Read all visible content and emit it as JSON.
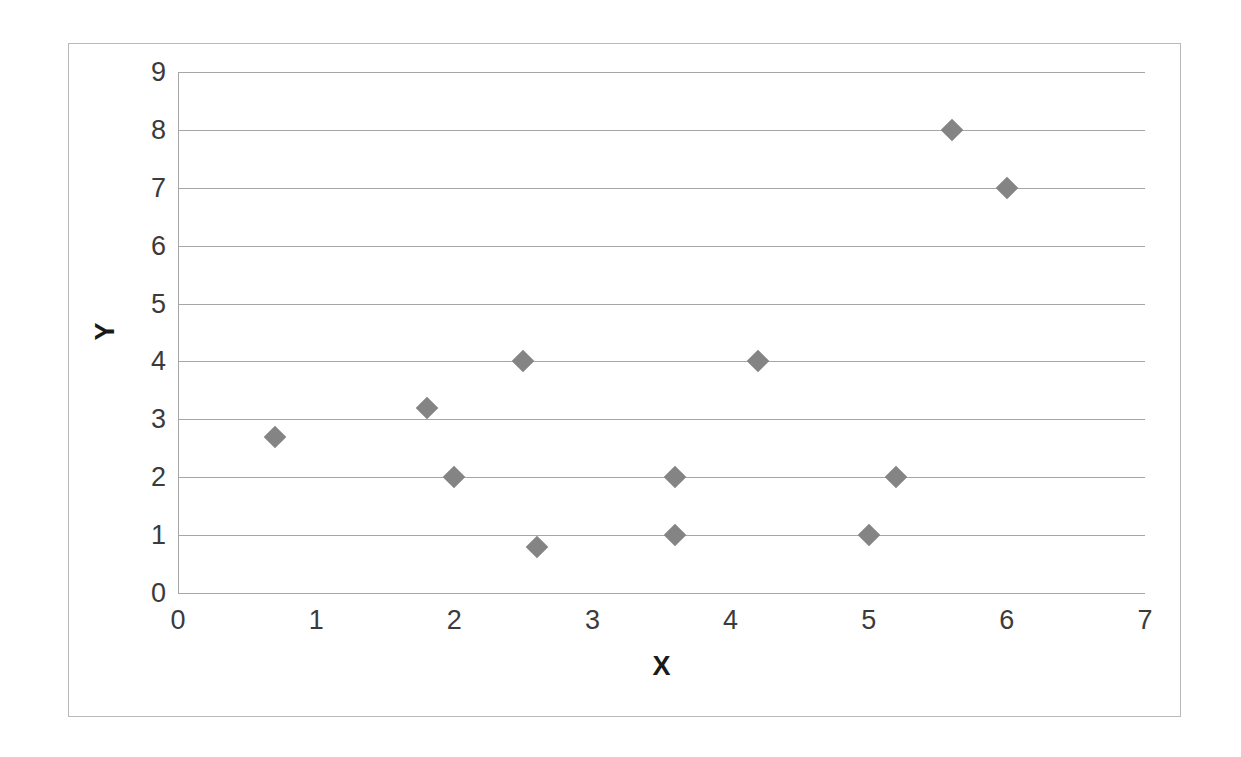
{
  "chart_data": {
    "type": "scatter",
    "title": "",
    "xlabel": "X",
    "ylabel": "Y",
    "xlim": [
      0,
      7
    ],
    "ylim": [
      0,
      9
    ],
    "x_ticks": [
      "0",
      "1",
      "2",
      "3",
      "4",
      "5",
      "6",
      "7"
    ],
    "y_ticks": [
      "0",
      "1",
      "2",
      "3",
      "4",
      "5",
      "6",
      "7",
      "8",
      "9"
    ],
    "grid": "horizontal",
    "legend": "none",
    "marker_shape": "diamond",
    "marker_color": "#848484",
    "series": [
      {
        "name": "series-1",
        "points": [
          {
            "x": 0.7,
            "y": 2.7
          },
          {
            "x": 1.8,
            "y": 3.2
          },
          {
            "x": 2.0,
            "y": 2.0
          },
          {
            "x": 2.5,
            "y": 4.0
          },
          {
            "x": 2.6,
            "y": 0.8
          },
          {
            "x": 3.6,
            "y": 2.0
          },
          {
            "x": 3.6,
            "y": 1.0
          },
          {
            "x": 4.2,
            "y": 4.0
          },
          {
            "x": 5.0,
            "y": 1.0
          },
          {
            "x": 5.2,
            "y": 2.0
          },
          {
            "x": 5.6,
            "y": 8.0
          },
          {
            "x": 6.0,
            "y": 7.0
          }
        ]
      }
    ]
  },
  "colors": {
    "marker": "#848484",
    "gridline": "#a6a6a6",
    "border": "#b9b9b9",
    "tick_text": "#3b3b3b",
    "axis_title": "#1a1a1a",
    "background": "#ffffff"
  }
}
